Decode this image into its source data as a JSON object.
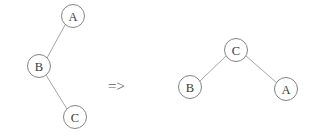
{
  "diagram": {
    "background_color": "#ffffff",
    "node_fill_color": "#ffffff",
    "node_stroke_color": "#7d7d7d",
    "edge_color": "#9a9a9a",
    "label_color": "#3a3a3a",
    "arrow": {
      "symbol": "=>",
      "x": 108,
      "y": 79
    },
    "left_tree": {
      "name": "before-tree",
      "nodes": [
        {
          "id": "A",
          "label": "A",
          "cx": 73,
          "cy": 16,
          "r": 11.5
        },
        {
          "id": "B",
          "label": "B",
          "cx": 39,
          "cy": 66,
          "r": 11.5
        },
        {
          "id": "C",
          "label": "C",
          "cx": 75,
          "cy": 117,
          "r": 11.5
        }
      ],
      "edges": [
        {
          "from": "B",
          "to": "A"
        },
        {
          "from": "B",
          "to": "C"
        }
      ]
    },
    "right_tree": {
      "name": "after-tree",
      "nodes": [
        {
          "id": "C",
          "label": "C",
          "cx": 236,
          "cy": 50,
          "r": 11.5
        },
        {
          "id": "B",
          "label": "B",
          "cx": 190,
          "cy": 87,
          "r": 11.5
        },
        {
          "id": "A",
          "label": "A",
          "cx": 286,
          "cy": 89,
          "r": 11.5
        }
      ],
      "edges": [
        {
          "from": "C",
          "to": "B"
        },
        {
          "from": "C",
          "to": "A"
        }
      ]
    }
  }
}
